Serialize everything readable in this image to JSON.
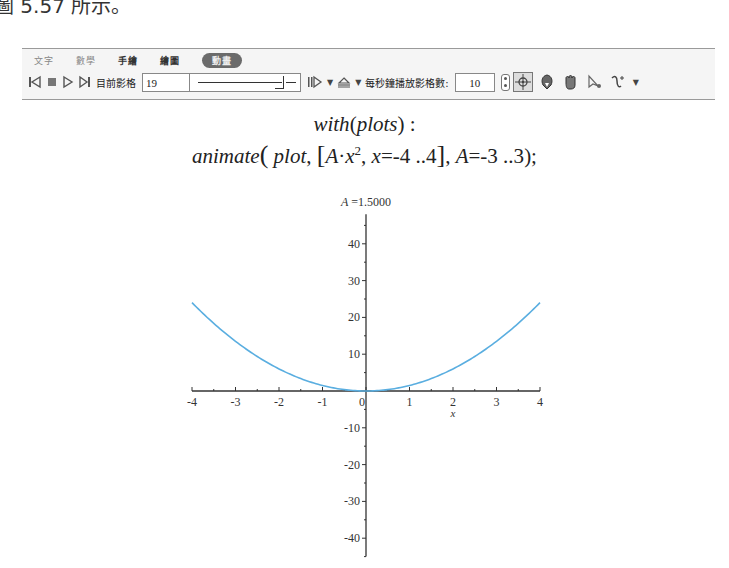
{
  "caption": "圖 5.57 所示。",
  "toolbar": {
    "tabs": [
      {
        "label": "文字",
        "active": false
      },
      {
        "label": "數學",
        "active": false
      },
      {
        "label": "手繪",
        "active": false
      },
      {
        "label": "繪圖",
        "active": false
      },
      {
        "label": "動畫",
        "active": true
      }
    ],
    "controls": {
      "first_frame_icon": "skip-to-start-icon",
      "stop_icon": "stop-icon",
      "play_icon": "play-icon",
      "next_frame_icon": "step-forward-icon",
      "current_frame_label": "目前影格",
      "current_frame_value": "19",
      "slider_fraction": 0.95,
      "play_mode_icon": "play-mode-icon",
      "direction_icon": "direction-icon",
      "fps_label": "每秒鐘播放影格數:",
      "fps_value": "10"
    },
    "tools": [
      "pointer-crosshair-icon",
      "rotate-icon",
      "pan-hand-icon",
      "scale-pointer-icon",
      "curve-tool-icon"
    ]
  },
  "math": {
    "line1": {
      "func": "with",
      "arg": "plots",
      "suffix": " :"
    },
    "line2": {
      "func": "animate",
      "p1": "plot",
      "expr_coef": "A",
      "expr_dot": "·",
      "expr_var": "x",
      "expr_exp": "2",
      "range_var": "x",
      "range": "=-4 ..4",
      "param_var": "A",
      "param_range": "=-3 ..3",
      "end": ");"
    }
  },
  "chart_data": {
    "type": "line",
    "title": "A =1.5000",
    "title_var": "A",
    "title_value": "=1.5000",
    "xlabel": "x",
    "ylabel": "",
    "xlim": [
      -4,
      4
    ],
    "ylim": [
      -45,
      48
    ],
    "x_ticks": [
      -4,
      -3,
      -2,
      -1,
      0,
      1,
      2,
      3,
      4
    ],
    "y_ticks": [
      -40,
      -30,
      -20,
      -10,
      10,
      20,
      30,
      40
    ],
    "grid": false,
    "series": [
      {
        "name": "1.5*x^2",
        "function": "A*x^2",
        "A": 1.5,
        "x_range": [
          -4,
          4
        ],
        "color": "#5aaee0"
      }
    ]
  }
}
